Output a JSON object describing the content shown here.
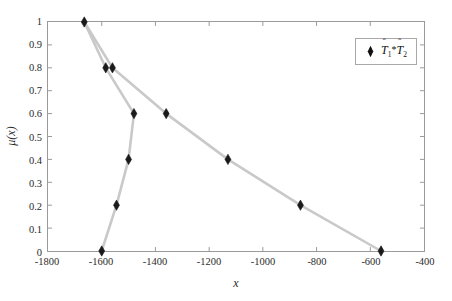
{
  "chart_data": {
    "type": "line",
    "title": "",
    "xlabel": "x",
    "ylabel": "μ(x)",
    "xlim": [
      -1800,
      -400
    ],
    "ylim": [
      0,
      1
    ],
    "xticks": [
      -1800,
      -1600,
      -1400,
      -1200,
      -1000,
      -800,
      -600,
      -400
    ],
    "xtick_labels": [
      "-1800",
      "-1600",
      "-1400",
      "-1200",
      "-1000",
      "-800",
      "-600",
      "-400"
    ],
    "yticks": [
      0,
      0.1,
      0.2,
      0.3,
      0.4,
      0.5,
      0.6,
      0.7,
      0.8,
      0.9,
      1
    ],
    "ytick_labels": [
      "0",
      "0.1",
      "0.2",
      "0.3",
      "0.4",
      "0.5",
      "0.6",
      "0.7",
      "0.8",
      "0.9",
      "1"
    ],
    "grid": false,
    "legend_position": "upper right",
    "line_color": "#c9c9c9",
    "marker_color": "#1a1a1a",
    "marker": "diamond",
    "series": [
      {
        "name": "T̂1*T̂2",
        "legend_label_plain": "T1*T2",
        "branches": [
          {
            "name": "left-branch",
            "x": [
              -1665,
              -1585,
              -1480,
              -1500,
              -1545,
              -1600
            ],
            "y": [
              1,
              0.8,
              0.6,
              0.4,
              0.2,
              0
            ]
          },
          {
            "name": "right-branch",
            "x": [
              -1665,
              -1560,
              -1360,
              -1130,
              -860,
              -560
            ],
            "y": [
              1,
              0.8,
              0.6,
              0.4,
              0.2,
              0
            ]
          }
        ]
      }
    ],
    "markers": [
      {
        "x": -1665,
        "y": 1
      },
      {
        "x": -1585,
        "y": 0.8
      },
      {
        "x": -1560,
        "y": 0.8
      },
      {
        "x": -1480,
        "y": 0.6
      },
      {
        "x": -1500,
        "y": 0.4
      },
      {
        "x": -1545,
        "y": 0.2
      },
      {
        "x": -1600,
        "y": 0
      },
      {
        "x": -1360,
        "y": 0.6
      },
      {
        "x": -1130,
        "y": 0.4
      },
      {
        "x": -860,
        "y": 0.2
      },
      {
        "x": -560,
        "y": 0
      }
    ]
  },
  "legend": {
    "t_letter": "T",
    "hat": "ˆ",
    "sub1": "1",
    "star": "*",
    "sub2": "2"
  },
  "axes": {
    "xlabel": "x",
    "ylabel": "μ(x)"
  }
}
